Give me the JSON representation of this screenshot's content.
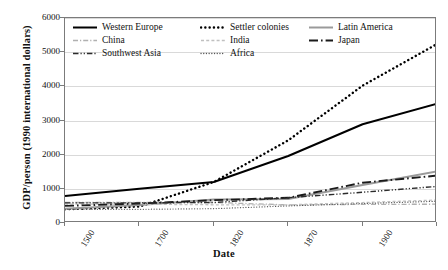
{
  "chart_data": {
    "type": "line",
    "title": "",
    "xlabel": "Date",
    "ylabel": "GDP/person (1990 international dollars)",
    "categories": [
      "1500",
      "1700",
      "1820",
      "1870",
      "1900",
      "1913"
    ],
    "ylim": [
      0,
      6000
    ],
    "yticks": [
      0,
      1000,
      2000,
      3000,
      4000,
      5000,
      6000
    ],
    "grid": true,
    "legend_position": "top-inside",
    "series": [
      {
        "name": "Western Europe",
        "values": [
          790,
          1000,
          1200,
          1960,
          2890,
          3490
        ],
        "style": "solid",
        "color": "#000000",
        "width": 2.0
      },
      {
        "name": "Settler colonies",
        "values": [
          400,
          480,
          1200,
          2420,
          4020,
          5240
        ],
        "style": "dotted-bold",
        "color": "#000000",
        "width": 2.4
      },
      {
        "name": "Latin America",
        "values": [
          420,
          530,
          690,
          700,
          1110,
          1510
        ],
        "style": "solid",
        "color": "#9a9a9a",
        "width": 2.0
      },
      {
        "name": "China",
        "values": [
          600,
          600,
          600,
          530,
          545,
          550
        ],
        "style": "dash-dot",
        "color": "#b0b0b0",
        "width": 1.3
      },
      {
        "name": "India",
        "values": [
          550,
          550,
          533,
          533,
          599,
          673
        ],
        "style": "dashed-fine",
        "color": "#c0c0c0",
        "width": 1.3
      },
      {
        "name": "Japan",
        "values": [
          500,
          570,
          669,
          737,
          1180,
          1387
        ],
        "style": "long-dash-dot",
        "color": "#1a1a1a",
        "width": 1.9
      },
      {
        "name": "Southwest Asia",
        "values": [
          590,
          590,
          600,
          740,
          900,
          1070
        ],
        "style": "dash-dot-dot",
        "color": "#2b2b2b",
        "width": 1.4
      },
      {
        "name": "Africa",
        "values": [
          400,
          400,
          420,
          500,
          570,
          637
        ],
        "style": "dotted-fine",
        "color": "#555555",
        "width": 1.2
      }
    ],
    "legend_order": [
      "Western Europe",
      "Settler colonies",
      "Latin America",
      "China",
      "India",
      "Japan",
      "Southwest Asia",
      "Africa"
    ]
  }
}
